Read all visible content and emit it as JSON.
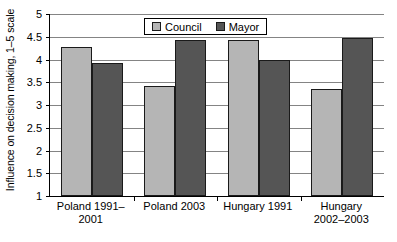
{
  "chart_data": {
    "type": "bar",
    "title": "",
    "xlabel": "",
    "ylabel": "Influence on decision making, 1–5 scale",
    "ylim": [
      1,
      5
    ],
    "ytick_labels": [
      "5",
      "4.5",
      "4",
      "3.5",
      "3",
      "2.5",
      "2",
      "1.5",
      "1"
    ],
    "ytick_values": [
      5,
      4.5,
      4,
      3.5,
      3,
      2.5,
      2,
      1.5,
      1
    ],
    "grid": "horizontal",
    "legend_position": "top-center",
    "categories": [
      "Poland 1991–2001",
      "Poland 2003",
      "Hungary 1991",
      "Hungary 2002–2003"
    ],
    "category_lines": [
      [
        "Poland 1991–",
        "2001"
      ],
      [
        "Poland 2003",
        ""
      ],
      [
        "Hungary 1991",
        ""
      ],
      [
        "Hungary",
        "2002–2003"
      ]
    ],
    "series": [
      {
        "name": "Council",
        "color": "#b5b5b5",
        "values": [
          4.28,
          3.41,
          4.43,
          3.36
        ]
      },
      {
        "name": "Mayor",
        "color": "#555555",
        "values": [
          3.93,
          4.43,
          3.99,
          4.47
        ]
      }
    ]
  },
  "legend": {
    "items": [
      {
        "label": "Council",
        "color": "#b5b5b5"
      },
      {
        "label": "Mayor",
        "color": "#555555"
      }
    ]
  },
  "axis": {
    "y_title": "Influence on decision making, 1–5 scale"
  }
}
